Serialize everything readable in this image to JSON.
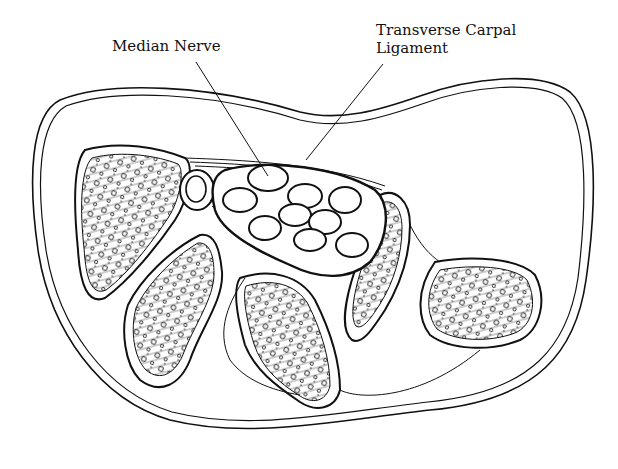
{
  "figure": {
    "labels": {
      "median_nerve": "Median Nerve",
      "transverse_carpal_ligament_line1": "Transverse Carpal",
      "transverse_carpal_ligament_line2": "Ligament"
    },
    "structures": {
      "tendon_count": 9,
      "bone_count": 5
    },
    "colors": {
      "ink": "#111111",
      "background": "#ffffff"
    }
  }
}
